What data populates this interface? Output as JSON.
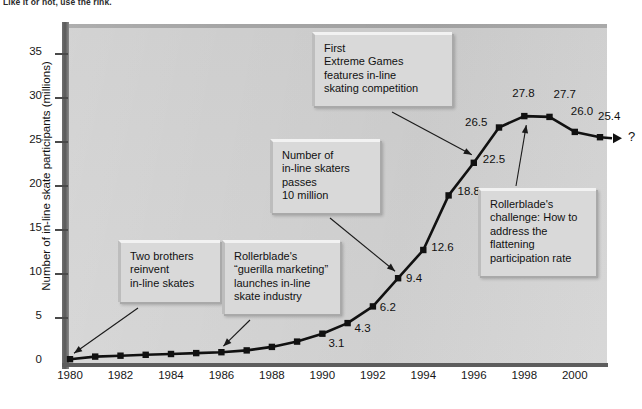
{
  "figure": {
    "top_caption": "Like it or not, use the rink."
  },
  "chart_data": {
    "type": "line",
    "title": "",
    "xlabel": "",
    "ylabel": "Number of in-line skate participants (millions)",
    "xlim": [
      1980,
      2001
    ],
    "ylim": [
      0,
      37
    ],
    "y_ticks": [
      "0",
      "5",
      "10",
      "15",
      "20",
      "25",
      "30",
      "35"
    ],
    "y_tick_values": [
      0,
      5,
      10,
      15,
      20,
      25,
      30,
      35
    ],
    "x_ticks": [
      "1980",
      "1982",
      "1984",
      "1986",
      "1988",
      "1990",
      "1992",
      "1994",
      "1996",
      "1998",
      "2000"
    ],
    "x_tick_values": [
      1980,
      1982,
      1984,
      1986,
      1988,
      1990,
      1992,
      1994,
      1996,
      1998,
      2000
    ],
    "grid": false,
    "legend": "none",
    "marker": "square",
    "line_color": "#111111",
    "panel_color": "#d2d2d2",
    "x": [
      1980,
      1981,
      1982,
      1983,
      1984,
      1985,
      1986,
      1987,
      1988,
      1989,
      1990,
      1991,
      1992,
      1993,
      1994,
      1995,
      1996,
      1997,
      1998,
      1999,
      2000
    ],
    "values": [
      0.2,
      0.5,
      0.6,
      0.7,
      0.8,
      0.9,
      1.0,
      1.2,
      1.6,
      2.2,
      3.1,
      4.3,
      6.2,
      9.4,
      12.6,
      18.8,
      22.5,
      26.5,
      27.8,
      27.7,
      26.0
    ],
    "series": [
      {
        "name": "In-line skate participants",
        "values": [
          0.2,
          0.5,
          0.6,
          0.7,
          0.8,
          0.9,
          1.0,
          1.2,
          1.6,
          2.2,
          3.1,
          4.3,
          6.2,
          9.4,
          12.6,
          18.8,
          22.5,
          26.5,
          27.8,
          27.7,
          26.0
        ]
      }
    ],
    "point_labels": [
      {
        "x": 1990,
        "y": 3.1,
        "text": "3.1"
      },
      {
        "x": 1991,
        "y": 4.3,
        "text": "4.3"
      },
      {
        "x": 1992,
        "y": 6.2,
        "text": "6.2"
      },
      {
        "x": 1993,
        "y": 9.4,
        "text": "9.4"
      },
      {
        "x": 1994,
        "y": 12.6,
        "text": "12.6"
      },
      {
        "x": 1995,
        "y": 18.8,
        "text": "18.8"
      },
      {
        "x": 1996,
        "y": 22.5,
        "text": "22.5"
      },
      {
        "x": 1997,
        "y": 26.5,
        "text": "26.5"
      },
      {
        "x": 1998,
        "y": 27.8,
        "text": "27.8"
      },
      {
        "x": 1999,
        "y": 27.7,
        "text": "27.7"
      },
      {
        "x": 2000,
        "y": 26.0,
        "text": "26.0"
      },
      {
        "x": 2001,
        "y": 25.4,
        "text": "25.4"
      }
    ],
    "forecast": {
      "from": {
        "x": 2000,
        "y": 26.0
      },
      "to": {
        "x": 2001,
        "y": 25.4
      },
      "label": "25.4",
      "arrow_label": "?"
    },
    "annotations": [
      {
        "id": "two-brothers",
        "lines": [
          "Two brothers",
          "reinvent",
          "in-line skates"
        ],
        "points_to": {
          "x": 1980,
          "y": 0.2
        }
      },
      {
        "id": "guerilla-marketing",
        "lines": [
          "Rollerblade's",
          "“guerilla marketing”",
          "launches in-line",
          "skate industry"
        ],
        "points_to": {
          "x": 1986,
          "y": 1.0
        }
      },
      {
        "id": "ten-million",
        "lines": [
          "Number of",
          "in-line skaters",
          "passes",
          "10 million"
        ],
        "points_to": {
          "x": 1993,
          "y": 9.4
        }
      },
      {
        "id": "extreme-games",
        "lines": [
          "First",
          "Extreme Games",
          "features in-line",
          "skating competition"
        ],
        "points_to": {
          "x": 1996,
          "y": 22.5
        }
      },
      {
        "id": "flattening-challenge",
        "lines": [
          "Rollerblade's",
          "challenge: How to",
          "address the",
          "flattening",
          "participation rate"
        ],
        "points_to": {
          "x": 1998,
          "y": 27.8
        }
      }
    ]
  }
}
